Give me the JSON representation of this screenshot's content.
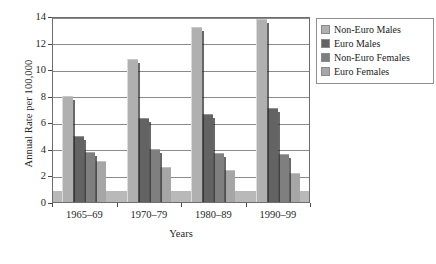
{
  "chart_data": {
    "type": "bar",
    "title": "",
    "subtitle": "",
    "xlabel": "Years",
    "ylabel": "Annual Rate per 100,000",
    "categories": [
      "1965–69",
      "1970–79",
      "1980–89",
      "1990–99"
    ],
    "series": [
      {
        "name": "Non-Euro Males",
        "color": "#b0b0b0",
        "values": [
          8.0,
          10.8,
          13.2,
          13.8
        ]
      },
      {
        "name": "Euro Males",
        "color": "#636363",
        "values": [
          5.0,
          6.3,
          6.6,
          7.1
        ]
      },
      {
        "name": "Non-Euro Females",
        "color": "#7f7f7f",
        "values": [
          3.8,
          4.0,
          3.7,
          3.6
        ]
      },
      {
        "name": "Euro Females",
        "color": "#a6a6a6",
        "values": [
          3.1,
          2.6,
          2.4,
          2.2
        ]
      }
    ],
    "ylim": [
      0,
      14
    ],
    "yticks": [
      0,
      2,
      4,
      6,
      8,
      10,
      12,
      14
    ],
    "ytick_labels": [
      "0",
      "2",
      "4",
      "6",
      "8",
      "10",
      "12",
      "14"
    ],
    "grid": "horizontal",
    "legend_position": "right-outside",
    "baseline_band_value": 0.85
  },
  "legend": {
    "entries": [
      {
        "label": "Non-Euro Males"
      },
      {
        "label": "Euro Males"
      },
      {
        "label": "Non-Euro Females"
      },
      {
        "label": "Euro Females"
      }
    ]
  }
}
